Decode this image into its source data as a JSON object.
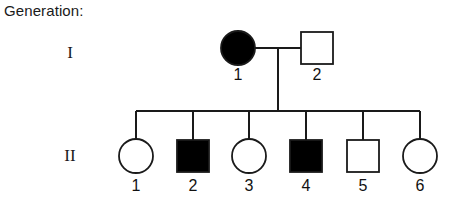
{
  "caption": {
    "generation_label": "Generation:"
  },
  "generations": [
    {
      "roman": "I",
      "y_symbol_center": 48,
      "y_label": 66,
      "members": [
        {
          "id": "1",
          "sex": "female",
          "shape": "circle",
          "affected": true,
          "fill": "#000000",
          "cx": 238,
          "cy": 48,
          "r": 17
        },
        {
          "id": "2",
          "sex": "male",
          "shape": "square",
          "affected": false,
          "fill": "#ffffff",
          "cx": 317,
          "cy": 48,
          "size": 32
        }
      ]
    },
    {
      "roman": "II",
      "y_symbol_center": 156,
      "y_label": 177,
      "members": [
        {
          "id": "1",
          "sex": "female",
          "shape": "circle",
          "affected": false,
          "fill": "#ffffff",
          "cx": 136,
          "cy": 156,
          "r": 17
        },
        {
          "id": "2",
          "sex": "male",
          "shape": "square",
          "affected": true,
          "fill": "#000000",
          "cx": 193,
          "cy": 156,
          "size": 32
        },
        {
          "id": "3",
          "sex": "female",
          "shape": "circle",
          "affected": false,
          "fill": "#ffffff",
          "cx": 249,
          "cy": 156,
          "r": 17
        },
        {
          "id": "4",
          "sex": "male",
          "shape": "square",
          "affected": true,
          "fill": "#000000",
          "cx": 306,
          "cy": 156,
          "size": 32
        },
        {
          "id": "5",
          "sex": "male",
          "shape": "square",
          "affected": false,
          "fill": "#ffffff",
          "cx": 363,
          "cy": 156,
          "size": 32
        },
        {
          "id": "6",
          "sex": "female",
          "shape": "circle",
          "affected": false,
          "fill": "#ffffff",
          "cx": 420,
          "cy": 156,
          "r": 17
        }
      ]
    }
  ],
  "connections": {
    "mating_line": {
      "x1": 255,
      "x2": 301,
      "y": 48
    },
    "descent_line": {
      "x": 278,
      "y1": 48,
      "y2": 111
    },
    "sibship_line": {
      "x1": 136,
      "x2": 420,
      "y": 111
    },
    "sibling_drops": [
      {
        "x": 136,
        "y1": 111,
        "y2": 139
      },
      {
        "x": 193,
        "y1": 111,
        "y2": 140
      },
      {
        "x": 249,
        "y1": 111,
        "y2": 139
      },
      {
        "x": 306,
        "y1": 111,
        "y2": 140
      },
      {
        "x": 363,
        "y1": 111,
        "y2": 140
      },
      {
        "x": 420,
        "y1": 111,
        "y2": 139
      }
    ]
  },
  "style": {
    "line_color": "#1a1a1a",
    "line_width": 1.6,
    "symbol_stroke": "#1a1a1a",
    "symbol_stroke_width": 1.8,
    "affected_fill": "#000000",
    "unaffected_fill": "#ffffff"
  }
}
